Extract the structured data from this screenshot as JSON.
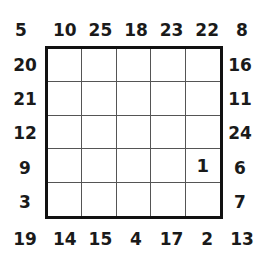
{
  "puzzle": {
    "top": [
      "10",
      "25",
      "18",
      "23",
      "22"
    ],
    "bottom": [
      "14",
      "15",
      "4",
      "17",
      "2"
    ],
    "left": [
      "20",
      "21",
      "12",
      "9",
      "3"
    ],
    "right": [
      "16",
      "11",
      "24",
      "6",
      "7"
    ],
    "corners": {
      "top_left": "5",
      "top_right": "8",
      "bottom_left": "19",
      "bottom_right": "13"
    },
    "cells": [
      [
        "",
        "",
        "",
        "",
        ""
      ],
      [
        "",
        "",
        "",
        "",
        ""
      ],
      [
        "",
        "",
        "",
        "",
        ""
      ],
      [
        "",
        "",
        "",
        "",
        "1"
      ],
      [
        "",
        "",
        "",
        "",
        ""
      ]
    ]
  }
}
